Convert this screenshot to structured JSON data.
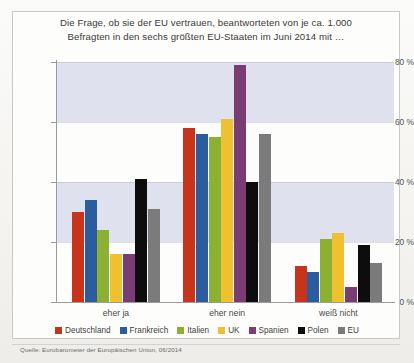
{
  "figure": {
    "title_line1": "Die Frage, ob sie der EU vertrauen, beantworteten von je ca. 1.000",
    "title_line2": "Befragten in den sechs größten EU-Staaten im Juni 2014 mit …",
    "source": "Quelle: Eurobarometer der Europäischen Union, 06/2014"
  },
  "chart_data": {
    "type": "bar",
    "title": "Die Frage, ob sie der EU vertrauen, beantworteten von je ca. 1.000 Befragten in den sechs größten EU-Staaten im Juni 2014 mit …",
    "xlabel": "",
    "ylabel": "",
    "ylim": [
      0,
      85
    ],
    "grid": true,
    "legend_position": "bottom",
    "categories": [
      "eher ja",
      "eher nein",
      "weiß nicht"
    ],
    "tick_labels": [
      "0 %",
      "20 %",
      "40 %",
      "60 %",
      "80 %"
    ],
    "tick_values": [
      0,
      20,
      40,
      60,
      80
    ],
    "series": [
      {
        "name": "Deutschland",
        "color": "#c7341b",
        "values": [
          30,
          58,
          12
        ]
      },
      {
        "name": "Frankreich",
        "color": "#2b5c9e",
        "values": [
          34,
          56,
          10
        ]
      },
      {
        "name": "Italien",
        "color": "#8cb032",
        "values": [
          24,
          55,
          21
        ]
      },
      {
        "name": "UK",
        "color": "#efc02f",
        "values": [
          16,
          61,
          23
        ]
      },
      {
        "name": "Spanien",
        "color": "#7a3d73",
        "values": [
          16,
          79,
          5
        ]
      },
      {
        "name": "Polen",
        "color": "#0d0d0d",
        "values": [
          41,
          40,
          19
        ]
      },
      {
        "name": "EU",
        "color": "#7b7b7b",
        "values": [
          31,
          56,
          13
        ]
      }
    ]
  }
}
